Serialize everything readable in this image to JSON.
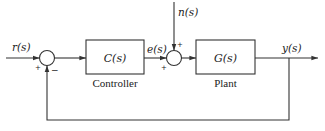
{
  "diagram": {
    "type": "closed-loop control block diagram",
    "signals": {
      "reference": "r(s)",
      "error": "e(s)",
      "disturbance": "n(s)",
      "output": "y(s)"
    },
    "blocks": [
      {
        "id": "controller",
        "transfer_function": "C(s)",
        "caption": "Controller"
      },
      {
        "id": "plant",
        "transfer_function": "G(s)",
        "caption": "Plant"
      }
    ],
    "summing_junctions": [
      {
        "id": "sum1",
        "input_signs": {
          "left": "+",
          "bottom": "−"
        }
      },
      {
        "id": "sum2",
        "input_signs": {
          "left": "+",
          "top": "+"
        }
      }
    ],
    "colors": {
      "line": "#333333",
      "background": "#ffffff"
    }
  }
}
